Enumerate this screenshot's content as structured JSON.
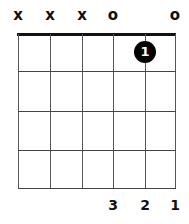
{
  "chord": {
    "strings": 6,
    "frets_shown": 4,
    "open_muted": [
      "x",
      "x",
      "x",
      "o",
      "",
      "o"
    ],
    "dots": [
      {
        "string": 5,
        "fret": 1,
        "label": "1"
      }
    ],
    "fingering": [
      "",
      "",
      "",
      "3",
      "2",
      "1"
    ]
  },
  "colors": {
    "grid": "#444444",
    "nut": "#111111",
    "dot": "#000000",
    "dot_text": "#ffffff"
  }
}
